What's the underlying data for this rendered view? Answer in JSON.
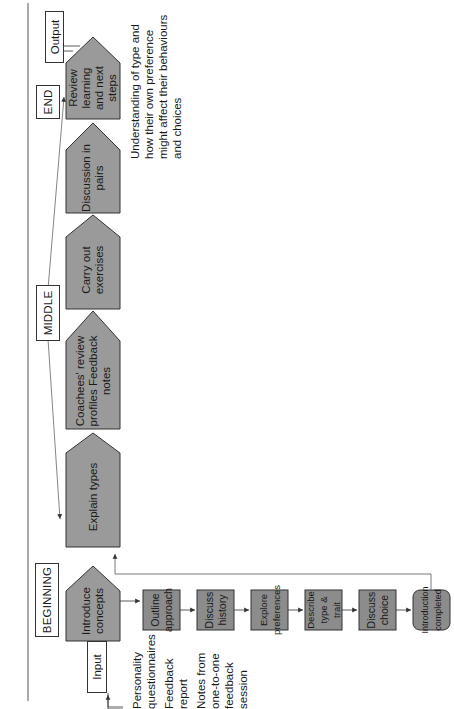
{
  "phases": {
    "beginning": "BEGINNING",
    "middle": "MIDDLE",
    "end": "END"
  },
  "io": {
    "input": "Input",
    "output": "Output"
  },
  "inputs_list": [
    "Personality questionnaires",
    "Feedback report",
    "Notes from one-to-one feedback session"
  ],
  "main_flow": [
    {
      "label": "Introduce concepts"
    },
    {
      "label": "Explain types"
    },
    {
      "label": "Coachees' review profiles Feedback notes"
    },
    {
      "label": "Carry out exercises"
    },
    {
      "label": "Discussion in pairs"
    },
    {
      "label": "Review learning and next steps"
    }
  ],
  "intro_subflow": [
    {
      "label": "Outline approach"
    },
    {
      "label": "Discuss history"
    },
    {
      "label": "Explore preferences"
    },
    {
      "label": "Describe type & trait"
    },
    {
      "label": "Discuss choice"
    },
    {
      "label": "Introduction completed"
    }
  ],
  "output_description": "Understanding of type and how their own preference might affect their behaviours and choices",
  "colors": {
    "box_fill": "#9a9a9a",
    "box_fill_dark": "#8c8c8c",
    "stroke": "#333333",
    "background": "#ffffff"
  }
}
